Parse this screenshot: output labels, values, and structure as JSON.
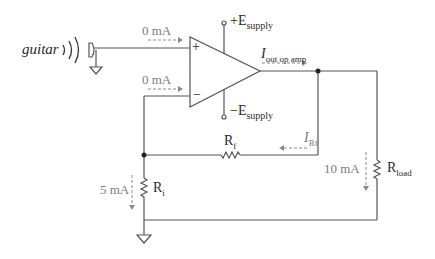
{
  "diagram": {
    "type": "op-amp non-inverting amplifier circuit",
    "colors": {
      "wire": "#555555",
      "current_arrow": "#8a8a8a",
      "label": "#3a3a3a",
      "current_label": "#7d7d7d"
    },
    "source": {
      "label": "guitar"
    },
    "opamp": {
      "plus_sign": "+",
      "minus_sign": "−",
      "positive_supply": {
        "prefix": "+E",
        "subscript": "supply"
      },
      "negative_supply": {
        "prefix": "−E",
        "subscript": "supply"
      }
    },
    "currents": {
      "noninverting_input": "0  mA",
      "inverting_input": "0  mA",
      "output": {
        "symbol": "I",
        "subscript": "out op amp"
      },
      "feedback": {
        "symbol": "I",
        "subscript": "Rf"
      },
      "load": "10 mA",
      "ri": "5 mA"
    },
    "resistors": {
      "rf": {
        "symbol": "R",
        "subscript": "f"
      },
      "ri": {
        "symbol": "R",
        "subscript": "i"
      },
      "rload": {
        "symbol": "R",
        "subscript": "load"
      }
    }
  }
}
